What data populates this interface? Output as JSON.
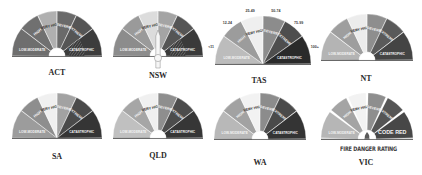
{
  "colors": {
    "low_moderate": "#8a8a8a",
    "high": "#7d7d7d",
    "very_high": "#e8e8e8",
    "severe": "#8e8e8e",
    "extreme": "#5a5a5a",
    "catastrophic": "#3a3a3a",
    "code_red": "#4a4a4a",
    "hub": "#ffffff"
  },
  "gauges": [
    {
      "state": "ACT",
      "segments": [
        {
          "label": "LOW-MODERATE",
          "color": "#6e6e6e"
        },
        {
          "label": "HIGH",
          "color": "#707070"
        },
        {
          "label": "VERY HIGH",
          "color": "#b0b0b0"
        },
        {
          "label": "SEVERE",
          "color": "#6a6a6a"
        },
        {
          "label": "EXTREME",
          "color": "#555555"
        },
        {
          "label": "CATASTROPHIC",
          "color": "#3c3c3c",
          "hatched": true
        }
      ],
      "hub": true,
      "needle": false
    },
    {
      "state": "NSW",
      "segments": [
        {
          "label": "LOW-MODERATE",
          "color": "#8c8c8c"
        },
        {
          "label": "HIGH",
          "color": "#9a9a9a"
        },
        {
          "label": "VERY HIGH",
          "color": "#dcdcdc"
        },
        {
          "label": "SEVERE",
          "color": "#a4a4a4"
        },
        {
          "label": "EXTREME",
          "color": "#555555"
        },
        {
          "label": "CATASTROPHIC",
          "color": "#3a3a3a",
          "hatched": true
        }
      ],
      "hub": true,
      "needle": true
    },
    {
      "state": "TAS",
      "segments": [
        {
          "label": "LOW-MODERATE",
          "color": "#bcbcbc",
          "range": "<11"
        },
        {
          "label": "HIGH",
          "color": "#9c9c9c",
          "range": "12-24"
        },
        {
          "label": "VERY HIGH",
          "color": "#efefef",
          "range": "25-49"
        },
        {
          "label": "SEVERE",
          "color": "#8c8c8c",
          "range": "50-74"
        },
        {
          "label": "EXTREME",
          "color": "#4e4e4e",
          "range": "75-99"
        },
        {
          "label": "CATASTROPHIC",
          "color": "#2a2a2a",
          "range": "100+"
        }
      ],
      "hub": false,
      "needle": false
    },
    {
      "state": "NT",
      "segments": [
        {
          "label": "LOW-MODERATE",
          "color": "#b4b4b4"
        },
        {
          "label": "HIGH",
          "color": "#9e9e9e"
        },
        {
          "label": "VERY HIGH",
          "color": "#ececec"
        },
        {
          "label": "SEVERE",
          "color": "#8e8e8e"
        },
        {
          "label": "EXTREME",
          "color": "#5a5a5a"
        },
        {
          "label": "CATASTROPHIC",
          "color": "#444444"
        }
      ],
      "hub": true,
      "needle": false
    },
    {
      "state": "SA",
      "segments": [
        {
          "label": "LOW-MODERATE",
          "color": "#9c9c9c"
        },
        {
          "label": "HIGH",
          "color": "#8e8e8e"
        },
        {
          "label": "VERY HIGH",
          "color": "#f0f0f0"
        },
        {
          "label": "SEVERE",
          "color": "#a2a2a2"
        },
        {
          "label": "EXTREME",
          "color": "#4a4a4a"
        },
        {
          "label": "CATASTROPHIC",
          "color": "#353535"
        }
      ],
      "hub": false,
      "needle": false
    },
    {
      "state": "QLD",
      "segments": [
        {
          "label": "LOW-MODERATE",
          "color": "#c0c0c0"
        },
        {
          "label": "HIGH",
          "color": "#a6a6a6"
        },
        {
          "label": "VERY HIGH",
          "color": "#f0f0f0"
        },
        {
          "label": "SEVERE",
          "color": "#8e8e8e"
        },
        {
          "label": "EXTREME",
          "color": "#4c4c4c"
        },
        {
          "label": "CATASTROPHIC",
          "color": "#363636"
        }
      ],
      "hub": true,
      "needle": false
    },
    {
      "state": "WA",
      "segments": [
        {
          "label": "LOW-MODERATE",
          "color": "#b8b8b8"
        },
        {
          "label": "HIGH",
          "color": "#a2a2a2"
        },
        {
          "label": "VERY HIGH",
          "color": "#f2f2f2"
        },
        {
          "label": "SEVERE",
          "color": "#8c8c8c"
        },
        {
          "label": "EXTREME",
          "color": "#4a4a4a"
        },
        {
          "label": "CATASTROPHIC",
          "color": "#343434"
        }
      ],
      "hub": true,
      "needle": false
    },
    {
      "state": "VIC",
      "segments": [
        {
          "label": "LOW-MODERATE",
          "color": "#b6b6b6"
        },
        {
          "label": "HIGH",
          "color": "#a4a4a4"
        },
        {
          "label": "VERY HIGH",
          "color": "#f2f2f2"
        },
        {
          "label": "SEVERE",
          "color": "#8e8e8e"
        },
        {
          "label": "EXTREME",
          "color": "#555555"
        },
        {
          "label": "CODE RED",
          "color": "#474747"
        }
      ],
      "hub": true,
      "needle": false,
      "gapped": true,
      "caption": "FIRE DANGER RATING"
    }
  ]
}
